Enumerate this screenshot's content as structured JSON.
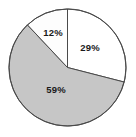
{
  "chart_data": {
    "type": "pie",
    "title": "",
    "subtitle": "",
    "xlabel": "",
    "ylabel": "",
    "legend_position": "none",
    "grid": false,
    "start_angle_deg": 0,
    "direction": "clockwise",
    "categories": [
      "Segment 1",
      "Segment 2",
      "Segment 3"
    ],
    "values": [
      29,
      59,
      12
    ],
    "labels": [
      "29%",
      "59%",
      "12%"
    ],
    "annotations": [],
    "slices": [
      {
        "label": "29%",
        "value": 29,
        "fill": "#ffffff",
        "stroke": "#4a4a4a",
        "start_deg": 0,
        "end_deg": 104.4,
        "label_x": 90,
        "label_y": 48
      },
      {
        "label": "59%",
        "value": 59,
        "fill": "#c6c6c6",
        "stroke": "#4a4a4a",
        "start_deg": 104.4,
        "end_deg": 316.8,
        "label_x": 56,
        "label_y": 90
      },
      {
        "label": "12%",
        "value": 12,
        "fill": "#fdfdfd",
        "stroke": "#4a4a4a",
        "start_deg": 316.8,
        "end_deg": 360,
        "label_x": 53,
        "label_y": 33
      }
    ]
  },
  "geometry": {
    "center_x": 67.5,
    "center_y": 67.5,
    "radius": 58.5
  },
  "colors": {
    "background": "#ffffff",
    "outline": "#4a4a4a",
    "label_text": "#1a1a1a",
    "slice_light": "#ffffff",
    "slice_gray": "#c6c6c6"
  },
  "caption": {
    "text": ""
  }
}
